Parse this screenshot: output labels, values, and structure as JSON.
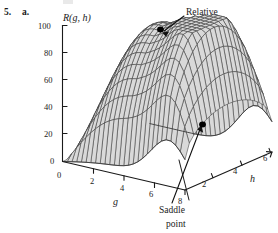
{
  "figure": {
    "problem_number": "5.",
    "problem_part": "a.",
    "vertical_axis_title": "R(g, h)",
    "g_axis_title": "g",
    "h_axis_title": "h",
    "z_ticks": [
      "0",
      "20",
      "40",
      "60",
      "80",
      "100"
    ],
    "z_tick_values": [
      0,
      20,
      40,
      60,
      80,
      100
    ],
    "g_ticks": [
      "0",
      "2",
      "4",
      "6",
      "8"
    ],
    "g_tick_values": [
      0,
      2,
      4,
      6,
      8
    ],
    "h_ticks": [
      "2",
      "4",
      "6"
    ],
    "h_tick_values": [
      2,
      4,
      6
    ],
    "annotations": [
      {
        "id": "relative-maximum",
        "line1": "Relative",
        "line2": "maximum"
      },
      {
        "id": "saddle-point",
        "line1": "Saddle",
        "line2": "point"
      }
    ],
    "colors": {
      "surface_fill": "#d9d9d9",
      "mesh_line": "#3b3b3b",
      "axis_line": "#1a1a1a",
      "text": "#1a1a1a",
      "marker": "#000000"
    }
  },
  "chart_data": {
    "type": "surface",
    "title": "R(g, h)",
    "xlabel": "g",
    "ylabel": "h",
    "zlabel": "R(g, h)",
    "xlim": [
      0,
      8
    ],
    "ylim": [
      0,
      6
    ],
    "zlim": [
      0,
      100
    ],
    "grid": false,
    "legend": "none",
    "projection": "3d-wireframe-surface",
    "features": [
      {
        "name": "Relative maximum",
        "g": 3.0,
        "h": 1.6,
        "R": 100
      },
      {
        "name": "Saddle point",
        "g": 7.2,
        "h": 1.4,
        "R": 33
      }
    ]
  }
}
